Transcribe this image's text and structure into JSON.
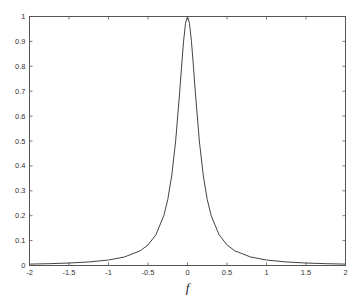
{
  "chart_data": {
    "type": "line",
    "title": "",
    "xlabel": "f",
    "ylabel": "",
    "xlim": [
      -2,
      2
    ],
    "ylim": [
      0,
      1
    ],
    "grid": false,
    "legend": null,
    "x_ticks": [
      -2,
      -1.5,
      -1,
      -0.5,
      0,
      0.5,
      1,
      1.5,
      2
    ],
    "x_tick_labels": [
      "-2",
      "-1.5",
      "-1",
      "-0.5",
      "0",
      "0.5",
      "1",
      "1.5",
      "2"
    ],
    "y_ticks": [
      0,
      0.1,
      0.2,
      0.3,
      0.4,
      0.5,
      0.6,
      0.7,
      0.8,
      0.9,
      1
    ],
    "y_tick_labels": [
      "0",
      "0.1",
      "0.2",
      "0.3",
      "0.4",
      "0.5",
      "0.6",
      "0.7",
      "0.8",
      "0.9",
      "1"
    ],
    "series": [
      {
        "name": "Lorentzian",
        "color": "#444444",
        "x": [
          -2,
          -1.75,
          -1.5,
          -1.25,
          -1,
          -0.8,
          -0.6,
          -0.5,
          -0.4,
          -0.3,
          -0.25,
          -0.2,
          -0.15,
          -0.1,
          -0.075,
          -0.05,
          -0.025,
          0,
          0.025,
          0.05,
          0.075,
          0.1,
          0.15,
          0.2,
          0.25,
          0.3,
          0.4,
          0.5,
          0.6,
          0.8,
          1,
          1.25,
          1.5,
          1.75,
          2
        ],
        "y": [
          0.0056,
          0.0073,
          0.0099,
          0.0142,
          0.022,
          0.034,
          0.0588,
          0.0826,
          0.1233,
          0.2,
          0.2647,
          0.36,
          0.5,
          0.6923,
          0.8,
          0.9,
          0.973,
          1.0,
          0.973,
          0.9,
          0.8,
          0.6923,
          0.5,
          0.36,
          0.2647,
          0.2,
          0.1233,
          0.0826,
          0.0588,
          0.034,
          0.022,
          0.0142,
          0.0099,
          0.0073,
          0.0056
        ]
      }
    ]
  }
}
